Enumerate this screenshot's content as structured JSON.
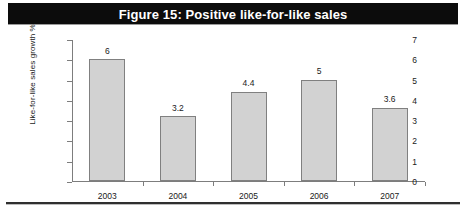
{
  "figure": {
    "title": "Figure 15: Positive like-for-like sales",
    "title_bar_color": "#0c0c0c",
    "title_text_color": "#ffffff"
  },
  "chart_data": {
    "type": "bar",
    "title": "Figure 15: Positive like-for-like sales",
    "categories": [
      "2003",
      "2004",
      "2005",
      "2006",
      "2007"
    ],
    "values": [
      6,
      3.2,
      4.4,
      5,
      3.6
    ],
    "data_labels": [
      "6",
      "3.2",
      "4.4",
      "5",
      "3.6"
    ],
    "xlabel": "",
    "ylabel": "Like-for-like sales growth %",
    "ylim": [
      0,
      7
    ],
    "ytick_labels": [
      "0",
      "1",
      "2",
      "3",
      "4",
      "5",
      "6",
      "7"
    ],
    "ytick_values": [
      0,
      1,
      2,
      3,
      4,
      5,
      6,
      7
    ],
    "grid": false,
    "legend": false,
    "bar_fill_color": "#d2d2d2",
    "bar_border_color": "#808080",
    "axis_color": "#7d7d7d"
  }
}
